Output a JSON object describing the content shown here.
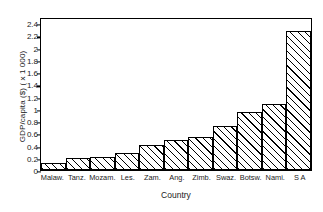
{
  "chart_data": {
    "type": "bar",
    "title": "",
    "xlabel": "Country",
    "ylabel": "GDP/capita ($) ( x 1 000)",
    "categories": [
      "Malaw.",
      "Tanz.",
      "Mozam.",
      "Les.",
      "Zam.",
      "Ang.",
      "Zimb.",
      "Swaz.",
      "Botsw.",
      "Nami.",
      "S A"
    ],
    "values": [
      0.11,
      0.2,
      0.22,
      0.28,
      0.42,
      0.49,
      0.55,
      0.73,
      0.96,
      1.09,
      2.3
    ],
    "ylim": [
      0,
      2.5
    ],
    "ytick_values": [
      0,
      0.2,
      0.4,
      0.6,
      0.8,
      1,
      1.2,
      1.4,
      1.6,
      1.8,
      2,
      2.2,
      2.4
    ],
    "ytick_labels": [
      "0",
      "0.2",
      "0.4",
      "0.6",
      "0.8",
      "1",
      "1.2",
      "1.4",
      "1.6",
      "1.8",
      "2",
      "2.2",
      "2.4"
    ],
    "grid": false,
    "legend": false,
    "legend_position": "none",
    "bar_style": "hatched-diagonal",
    "colors": {
      "bar_fill": "#ffffff",
      "bar_edge": "#000000",
      "hatch": "#000000",
      "axis": "#000000",
      "background": "#ffffff"
    }
  }
}
